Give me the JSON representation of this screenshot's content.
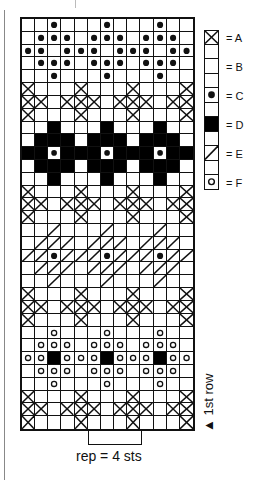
{
  "chart": {
    "columns": 13,
    "rows_count": 32,
    "symbols": {
      "A": "x-box",
      "B": "blank",
      "C": "filled-dot",
      "D": "solid-black",
      "E": "diagonal-slash",
      "F": "open-circle"
    },
    "rows": [
      "..C...C...C..",
      ".CCC.CCC.CCC.",
      "CC.CCC.CCC.CC",
      ".CCC.CCC.CCC.",
      "..C...C...C..",
      "A...A...A...A",
      "AA.AAA.AAA.AA",
      "A...A...A...A",
      "..D...D...D..",
      ".DDD.DDD.DDD.",
      "DDcDDDcDDDcDD",
      ".DDD.DDD.DDD.",
      "..D...D...D..",
      "A...A...A...A",
      "AA.AAA.AAA.AA",
      "A...A...A...A",
      "..E...E...E..",
      ".EEE.EEE.EEE.",
      "EECEEECEEECEE",
      ".EEE.EEE.EEE.",
      "..E...E...E..",
      "A...A...A...A",
      "AA.AAA.AAA.AA",
      "A...A...A...A",
      "..F...F...F..",
      ".FFF.FFF.FFF.",
      "FFDFFFDFFFDFF",
      ".FFF.FFF.FFF.",
      "..F...F...F..",
      "A...A...A...A",
      "AA.AAA.AAA.AA",
      "A...A...A...A"
    ]
  },
  "legend": [
    {
      "symbol": "A",
      "label": "= A",
      "icon": "x-box-icon"
    },
    {
      "symbol": "B",
      "label": "= B",
      "icon": "blank-box-icon"
    },
    {
      "symbol": "C",
      "label": "= C",
      "icon": "filled-dot-icon"
    },
    {
      "symbol": "D",
      "label": "= D",
      "icon": "solid-black-icon"
    },
    {
      "symbol": "E",
      "label": "= E",
      "icon": "diagonal-slash-icon"
    },
    {
      "symbol": "F",
      "label": "= F",
      "icon": "open-circle-icon"
    }
  ],
  "annotations": {
    "first_row": "▲ 1st row",
    "repeat": "rep = 4 sts"
  }
}
